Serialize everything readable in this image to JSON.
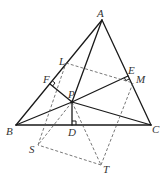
{
  "diagram": {
    "points": {
      "A": {
        "x": 102,
        "y": 20
      },
      "B": {
        "x": 16,
        "y": 125
      },
      "C": {
        "x": 151,
        "y": 125
      },
      "P": {
        "x": 72,
        "y": 102
      },
      "D": {
        "x": 72,
        "y": 125
      },
      "E": {
        "x": 128,
        "y": 76
      },
      "F": {
        "x": 50,
        "y": 84
      },
      "L": {
        "x": 66,
        "y": 63
      },
      "M": {
        "x": 133,
        "y": 83
      },
      "S": {
        "x": 38,
        "y": 145
      },
      "T": {
        "x": 101,
        "y": 165
      }
    },
    "labels": {
      "A": "A",
      "B": "B",
      "C": "C",
      "P": "P",
      "D": "D",
      "E": "E",
      "F": "F",
      "L": "L",
      "M": "M",
      "S": "S",
      "T": "T"
    },
    "solid_segments": [
      "AB",
      "BC",
      "CA",
      "PA",
      "PB",
      "PC",
      "PD",
      "PE",
      "PF"
    ],
    "dashed_segments": [
      "LM",
      "MT",
      "TS",
      "SL",
      "PS",
      "PT"
    ],
    "right_angles": [
      "D",
      "E",
      "F"
    ],
    "colors": {
      "line": "#1a1a1a",
      "dashed": "#555555",
      "label": "#333333",
      "background": "#ffffff"
    }
  }
}
